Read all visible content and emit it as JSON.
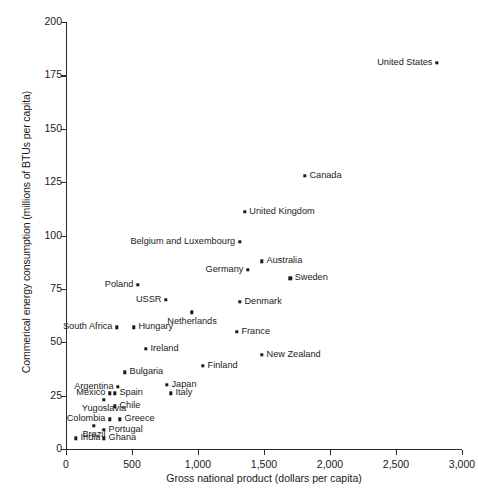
{
  "chart_data": {
    "type": "scatter",
    "title": "",
    "xlabel": "Gross national product (dollars per capita)",
    "ylabel": "Commerical energy consumption (millions of BTUs per capita)",
    "xlim": [
      0,
      3000
    ],
    "ylim": [
      0,
      200
    ],
    "xticks": [
      0,
      500,
      1000,
      1500,
      2000,
      2500,
      3000
    ],
    "xtick_labels": [
      "0",
      "500",
      "1,000",
      "1,500",
      "2,000",
      "2,500",
      "3,000"
    ],
    "yticks": [
      0,
      25,
      50,
      75,
      100,
      125,
      150,
      175,
      200
    ],
    "ytick_labels": [
      "0",
      "25",
      "50",
      "75",
      "100",
      "125",
      "150",
      "175",
      "200"
    ],
    "grid": false,
    "legend": null,
    "marker": "square-dot",
    "marker_color": "#1a1a1a",
    "points": [
      {
        "label": "United States",
        "x": 2810,
        "y": 181,
        "label_pos": "left"
      },
      {
        "label": "Canada",
        "x": 1810,
        "y": 128,
        "label_pos": "right"
      },
      {
        "label": "United Kingdom",
        "x": 1355,
        "y": 111,
        "label_pos": "right"
      },
      {
        "label": "Belgium and Luxembourg",
        "x": 1315,
        "y": 97,
        "label_pos": "left"
      },
      {
        "label": "Australia",
        "x": 1485,
        "y": 88,
        "label_pos": "right"
      },
      {
        "label": "Germany",
        "x": 1378,
        "y": 84,
        "label_pos": "left"
      },
      {
        "label": "Sweden",
        "x": 1698,
        "y": 80,
        "label_pos": "right"
      },
      {
        "label": "Poland",
        "x": 545,
        "y": 77,
        "label_pos": "left"
      },
      {
        "label": "USSR",
        "x": 757,
        "y": 70,
        "label_pos": "left"
      },
      {
        "label": "Denmark",
        "x": 1318,
        "y": 69,
        "label_pos": "right"
      },
      {
        "label": "Netherlands",
        "x": 955,
        "y": 64,
        "label_pos": "below"
      },
      {
        "label": "South Africa",
        "x": 386,
        "y": 57,
        "label_pos": "left"
      },
      {
        "label": "Hungary",
        "x": 515,
        "y": 57,
        "label_pos": "right"
      },
      {
        "label": "France",
        "x": 1295,
        "y": 55,
        "label_pos": "right"
      },
      {
        "label": "Ireland",
        "x": 606,
        "y": 47,
        "label_pos": "right"
      },
      {
        "label": "New Zealand",
        "x": 1485,
        "y": 44,
        "label_pos": "right"
      },
      {
        "label": "Finland",
        "x": 1038,
        "y": 39,
        "label_pos": "right"
      },
      {
        "label": "Bulgaria",
        "x": 447,
        "y": 36,
        "label_pos": "right"
      },
      {
        "label": "Japan",
        "x": 765,
        "y": 30,
        "label_pos": "right"
      },
      {
        "label": "Argentina",
        "x": 394,
        "y": 29,
        "label_pos": "left"
      },
      {
        "label": "Italy",
        "x": 795,
        "y": 26,
        "label_pos": "right"
      },
      {
        "label": "Mexico",
        "x": 333,
        "y": 26,
        "label_pos": "left"
      },
      {
        "label": "Spain",
        "x": 371,
        "y": 26,
        "label_pos": "right"
      },
      {
        "label": "Yugoslavia",
        "x": 288,
        "y": 23,
        "label_pos": "below"
      },
      {
        "label": "Chile",
        "x": 371,
        "y": 20,
        "label_pos": "right"
      },
      {
        "label": "Colombia",
        "x": 333,
        "y": 14,
        "label_pos": "left"
      },
      {
        "label": "Greece",
        "x": 409,
        "y": 14,
        "label_pos": "right"
      },
      {
        "label": "Brazil",
        "x": 212,
        "y": 11,
        "label_pos": "below"
      },
      {
        "label": "Portugal",
        "x": 288,
        "y": 9,
        "label_pos": "right"
      },
      {
        "label": "India",
        "x": 76,
        "y": 5,
        "label_pos": "right"
      },
      {
        "label": "Ghana",
        "x": 288,
        "y": 5,
        "label_pos": "right"
      }
    ]
  }
}
